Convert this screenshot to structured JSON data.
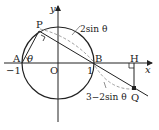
{
  "diagram": {
    "axes": {
      "x_label": "x",
      "y_label": "y",
      "origin_label": "O"
    },
    "ticks": {
      "neg_one": "−1",
      "one": "1"
    },
    "points": {
      "A": "A",
      "B": "B",
      "P": "P",
      "H": "H",
      "Q": "Q"
    },
    "angle_label": "θ",
    "annotations": {
      "upper": "2sin θ",
      "lower": "3−2sin θ"
    },
    "colors": {
      "stroke": "#222222",
      "dashed": "#888888"
    }
  }
}
